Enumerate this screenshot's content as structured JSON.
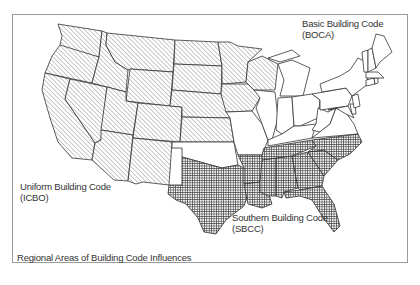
{
  "caption": "Regional Areas of Building Code Influences",
  "regions": [
    {
      "id": "icbo",
      "name": "Uniform Building Code",
      "abbr": "(ICBO)",
      "pattern": "diagonal-hatch",
      "states": [
        "WA",
        "OR",
        "CA",
        "NV",
        "ID",
        "MT",
        "WY",
        "UT",
        "AZ",
        "CO",
        "NM",
        "ND",
        "SD",
        "NE",
        "KS",
        "MN",
        "IA",
        "WI"
      ]
    },
    {
      "id": "boca",
      "name": "Basic Building Code",
      "abbr": "(BOCA)",
      "pattern": "none",
      "states": [
        "MI",
        "IL",
        "IN",
        "OH",
        "PA",
        "NY",
        "KY",
        "WV",
        "VA",
        "MD",
        "DE",
        "NJ",
        "CT",
        "RI",
        "MA",
        "VT",
        "NH",
        "ME",
        "MO",
        "OK"
      ]
    },
    {
      "id": "sbcc",
      "name": "Southern Building Code",
      "abbr": "(SBCC)",
      "pattern": "dot-grid",
      "states": [
        "TX",
        "LA",
        "AR",
        "MS",
        "AL",
        "TN",
        "GA",
        "FL",
        "SC",
        "NC"
      ]
    }
  ],
  "colors": {
    "stroke": "#333333",
    "frame": "#9a9a9a",
    "text": "#333333",
    "hatch": "#555555"
  }
}
